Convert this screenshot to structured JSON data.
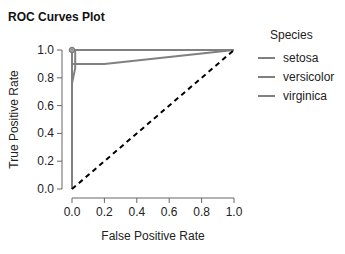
{
  "title": "ROC Curves Plot",
  "legend": {
    "title": "Species",
    "items": [
      {
        "label": "setosa",
        "color": "#808080"
      },
      {
        "label": "versicolor",
        "color": "#808080"
      },
      {
        "label": "virginica",
        "color": "#808080"
      }
    ]
  },
  "chart_data": {
    "type": "line",
    "title": "ROC Curves Plot",
    "xlabel": "False Positive Rate",
    "ylabel": "True Positive Rate",
    "xlim": [
      0,
      1
    ],
    "ylim": [
      0,
      1
    ],
    "x_ticks": [
      "0.0",
      "0.2",
      "0.4",
      "0.6",
      "0.8",
      "1.0"
    ],
    "y_ticks": [
      "0.0",
      "0.2",
      "0.4",
      "0.6",
      "0.8",
      "1.0"
    ],
    "grid": false,
    "legend_position": "right",
    "series": [
      {
        "name": "setosa",
        "color": "#808080",
        "x": [
          0,
          0,
          1
        ],
        "y": [
          0,
          1,
          1
        ],
        "marker_at": [
          0,
          1
        ]
      },
      {
        "name": "versicolor",
        "color": "#808080",
        "x": [
          0,
          0,
          0.02,
          0.02,
          1
        ],
        "y": [
          0,
          0.76,
          0.87,
          1,
          1
        ]
      },
      {
        "name": "virginica",
        "color": "#808080",
        "x": [
          0,
          0,
          0.2,
          1
        ],
        "y": [
          0,
          0.9,
          0.9,
          1
        ]
      },
      {
        "name": "chance",
        "color": "#000000",
        "style": "dashed",
        "x": [
          0,
          1
        ],
        "y": [
          0,
          1
        ]
      }
    ]
  }
}
